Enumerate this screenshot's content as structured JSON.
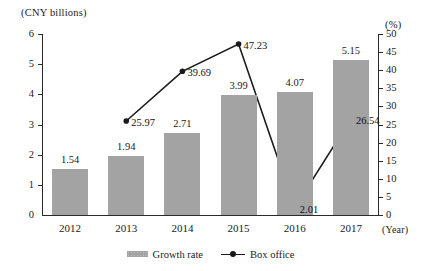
{
  "chart_data": {
    "type": "bar",
    "title": "",
    "subtitle": "",
    "categories": [
      "2012",
      "2013",
      "2014",
      "2015",
      "2016",
      "2017"
    ],
    "xlabel": "(Year)",
    "ylabel": "(CNY billions)",
    "y2label": "(%)",
    "ylim": [
      0,
      6
    ],
    "y2lim": [
      0,
      50
    ],
    "grid": false,
    "legend_position": "bottom-center",
    "y_ticks": [
      "0",
      "1",
      "2",
      "3",
      "4",
      "5",
      "6"
    ],
    "y2_ticks": [
      "0",
      "5",
      "10",
      "15",
      "20",
      "25",
      "30",
      "35",
      "40",
      "45",
      "50"
    ],
    "series": [
      {
        "name": "Growth rate",
        "render": "bar",
        "axis": "left",
        "color": "#a3a3a3",
        "x": [
          "2012",
          "2013",
          "2014",
          "2015",
          "2016",
          "2017"
        ],
        "values": [
          1.54,
          1.94,
          2.71,
          3.99,
          4.07,
          5.15
        ],
        "labels": [
          "1.54",
          "1.94",
          "2.71",
          "3.99",
          "4.07",
          "5.15"
        ]
      },
      {
        "name": "Box office",
        "render": "line",
        "axis": "right",
        "color": "#1a1a1a",
        "x": [
          "2013",
          "2014",
          "2015",
          "2016",
          "2017"
        ],
        "values": [
          25.97,
          39.69,
          47.23,
          2.01,
          26.54
        ],
        "labels": [
          "25.97",
          "39.69",
          "47.23",
          "2.01",
          "26.54"
        ]
      }
    ],
    "legend": [
      {
        "label": "Growth rate",
        "marker": "bar-swatch",
        "color": "#a3a3a3"
      },
      {
        "label": "Box office",
        "marker": "line-with-dot",
        "color": "#1a1a1a"
      }
    ]
  },
  "axis": {
    "left_unit": "(CNY billions)",
    "right_unit": "(%)",
    "x_unit": "(Year)"
  },
  "ticks": {
    "left": [
      "6",
      "5",
      "4",
      "3",
      "2",
      "1",
      "0"
    ],
    "right": [
      "50",
      "45",
      "40",
      "35",
      "30",
      "25",
      "20",
      "15",
      "10",
      "5",
      "0"
    ]
  },
  "categories": [
    "2012",
    "2013",
    "2014",
    "2015",
    "2016",
    "2017"
  ],
  "bars": [
    {
      "label": "1.54"
    },
    {
      "label": "1.94"
    },
    {
      "label": "2.71"
    },
    {
      "label": "3.99"
    },
    {
      "label": "4.07"
    },
    {
      "label": "5.15"
    }
  ],
  "points": [
    {
      "label": "25.97"
    },
    {
      "label": "39.69"
    },
    {
      "label": "47.23"
    },
    {
      "label": "2.01"
    },
    {
      "label": "26.54"
    }
  ],
  "legend": {
    "bar_label": "Growth rate",
    "line_label": "Box office"
  }
}
